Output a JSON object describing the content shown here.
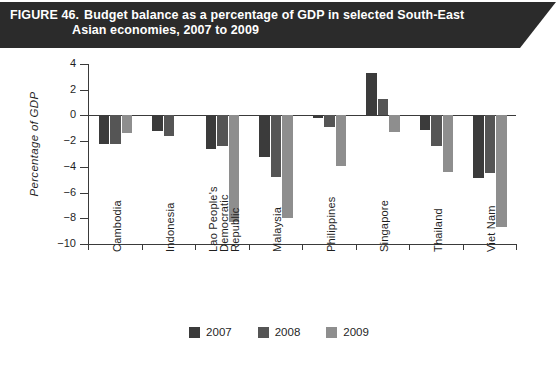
{
  "header": {
    "figure_number": "FIGURE 46.",
    "title_line1": "Budget balance as a percentage of GDP in selected South-East",
    "title_line2": "Asian economies, 2007 to 2009"
  },
  "chart_data": {
    "type": "bar",
    "title": "Budget balance as a percentage of GDP in selected South-East Asian economies, 2007 to 2009",
    "xlabel": "",
    "ylabel": "Percentage of GDP",
    "ylim": [
      -10,
      4
    ],
    "yticks": [
      "4",
      "2",
      "0",
      "-2",
      "-4",
      "-6",
      "-8",
      "-10"
    ],
    "ytick_values": [
      4,
      2,
      0,
      -2,
      -4,
      -6,
      -8,
      -10
    ],
    "grid": false,
    "legend_position": "bottom-center",
    "categories": [
      "Cambodia",
      "Indonesia",
      "Lao People's Democratic Republic",
      "Malaysia",
      "Philippines",
      "Singapore",
      "Thailand",
      "Viet Nam"
    ],
    "category_lines": [
      [
        "Cambodia"
      ],
      [
        "Indonesia"
      ],
      [
        "Lao People's",
        "Democratic",
        "Republic"
      ],
      [
        "Malaysia"
      ],
      [
        "Philippines"
      ],
      [
        "Singapore"
      ],
      [
        "Thailand"
      ],
      [
        "Viet Nam"
      ]
    ],
    "series": [
      {
        "name": "2007",
        "color": "#3b3b3b",
        "values": [
          -2.2,
          -1.2,
          -2.6,
          -3.2,
          -0.2,
          3.3,
          -1.1,
          -4.9
        ]
      },
      {
        "name": "2008",
        "color": "#555555",
        "values": [
          -2.2,
          -1.6,
          -2.4,
          -4.8,
          -0.9,
          1.3,
          -2.4,
          -4.5
        ]
      },
      {
        "name": "2009",
        "color": "#8e8e8e",
        "values": [
          -1.4,
          0.0,
          -8.3,
          -8.0,
          -3.9,
          -1.3,
          -4.4,
          -8.7
        ]
      }
    ]
  },
  "legend": {
    "items": [
      {
        "label": "2007",
        "color": "#3b3b3b"
      },
      {
        "label": "2008",
        "color": "#555555"
      },
      {
        "label": "2009",
        "color": "#8e8e8e"
      }
    ]
  }
}
